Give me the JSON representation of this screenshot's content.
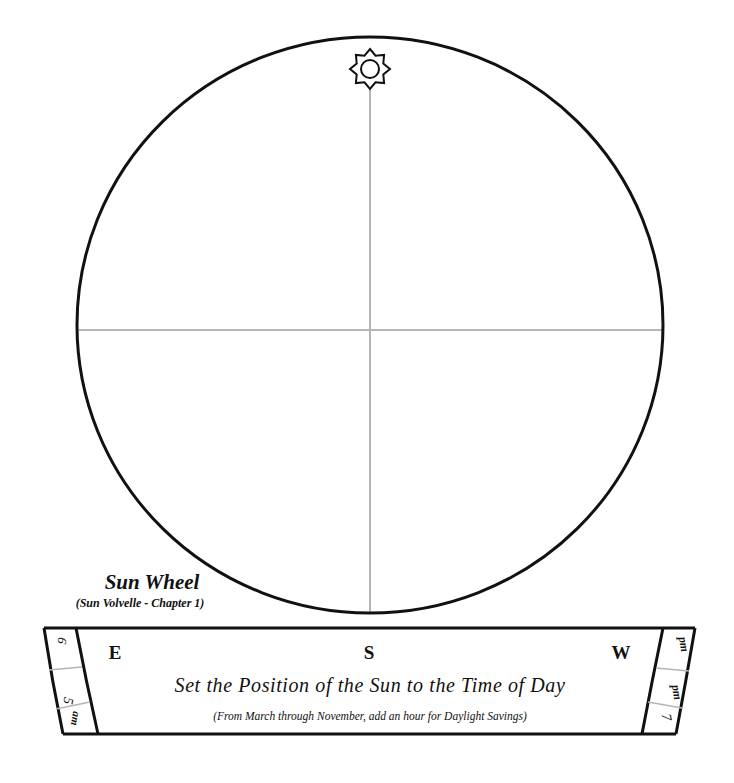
{
  "wheel": {
    "center_x": 370,
    "center_y": 325,
    "radius": 290,
    "stroke_color": "#111111",
    "crosshair_color": "#b5b5b5",
    "sun_icon": "sun-star-icon"
  },
  "caption": {
    "title": "Sun Wheel",
    "subtitle": "(Sun Volvelle - Chapter 1)"
  },
  "banner": {
    "directions": {
      "east": "E",
      "south": "S",
      "west": "W"
    },
    "heading": "Set the Position of the Sun to the Time of Day",
    "note": "(From March through November, add an hour for Daylight Savings)",
    "left_tab": {
      "top_label": "6",
      "hour_label": "5",
      "period_label": "am"
    },
    "right_tab": {
      "top_label": "pm",
      "hour_label": "7",
      "period_label": "pm"
    }
  }
}
